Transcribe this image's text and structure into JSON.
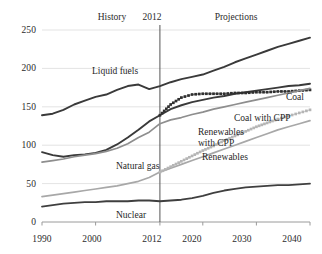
{
  "chart_data": {
    "type": "line",
    "title": "",
    "subtitle": "",
    "xlabel": "",
    "ylabel": "",
    "xlim": [
      1990,
      2040
    ],
    "ylim": [
      0,
      250
    ],
    "grid": true,
    "grid_axis": "y",
    "legend_position": "inline-annotations",
    "x_ticks": [
      "1990",
      "2000",
      "2012",
      "2020",
      "2030",
      "2040"
    ],
    "x_tick_values": [
      1990,
      2000,
      2012,
      2020,
      2030,
      2040
    ],
    "y_ticks": [
      "0",
      "50",
      "100",
      "150",
      "200",
      "250"
    ],
    "y_tick_values": [
      0,
      50,
      100,
      150,
      200,
      250
    ],
    "divider_year": 2012,
    "period_labels": [
      {
        "text": "History",
        "x": 2002
      },
      {
        "text": "2012",
        "x": 2012
      },
      {
        "text": "Projections",
        "x": 2027
      }
    ],
    "annotations": [
      {
        "text": "Liquid fuels",
        "x": 2002.5,
        "y": 196
      },
      {
        "text": "Coal",
        "x": 2038.5,
        "y": 188
      },
      {
        "text": "Coal with CPP",
        "x": 2034,
        "y": 163
      },
      {
        "text": "Renewables with CPP",
        "x": 2025.5,
        "y": 140
      },
      {
        "text": "Renewables",
        "x": 2027,
        "y": 104
      },
      {
        "text": "Natural gas",
        "x": 2006.5,
        "y": 78
      },
      {
        "text": "Nuclear",
        "x": 2012.5,
        "y": 14
      }
    ],
    "x": [
      1990,
      1992,
      1994,
      1996,
      1998,
      2000,
      2002,
      2004,
      2006,
      2008,
      2010,
      2012,
      2014,
      2016,
      2018,
      2020,
      2022,
      2024,
      2026,
      2028,
      2030,
      2032,
      2034,
      2036,
      2038,
      2040
    ],
    "series": [
      {
        "name": "Liquid fuels",
        "color": "#3a3a3a",
        "style": "solid",
        "width": 1.9,
        "values": [
          139,
          141,
          146,
          153,
          158,
          163,
          166,
          172,
          177,
          179,
          173,
          177,
          182,
          186,
          189,
          192,
          197,
          202,
          208,
          213,
          218,
          223,
          228,
          232,
          236,
          240
        ]
      },
      {
        "name": "Coal",
        "color": "#3a3a3a",
        "style": "solid",
        "width": 1.9,
        "values": [
          91,
          87,
          85,
          87,
          88,
          90,
          94,
          101,
          110,
          120,
          131,
          139,
          147,
          152,
          156,
          159,
          162,
          164,
          167,
          169,
          171,
          173,
          175,
          177,
          178,
          180
        ]
      },
      {
        "name": "Coal with CPP",
        "color": "#2f2f2f",
        "style": "dotted-square",
        "width": 1.6,
        "values": [
          null,
          null,
          null,
          null,
          null,
          null,
          null,
          null,
          null,
          null,
          null,
          139,
          153,
          162,
          166,
          167,
          167,
          167,
          168,
          168,
          169,
          169,
          170,
          170,
          171,
          172
        ]
      },
      {
        "name": "Natural gas",
        "color": "#8e8e8e",
        "style": "solid",
        "width": 1.7,
        "values": [
          78,
          80,
          82,
          85,
          87,
          89,
          92,
          96,
          102,
          110,
          117,
          128,
          133,
          136,
          140,
          143,
          147,
          150,
          153,
          156,
          159,
          162,
          165,
          168,
          171,
          174
        ]
      },
      {
        "name": "Renewables",
        "color": "#a8a8a8",
        "style": "solid",
        "width": 1.7,
        "values": [
          33,
          35,
          37,
          39,
          41,
          43,
          45,
          47,
          50,
          53,
          58,
          65,
          70,
          75,
          80,
          85,
          90,
          95,
          100,
          105,
          110,
          115,
          120,
          124,
          128,
          132
        ]
      },
      {
        "name": "Renewables with CPP",
        "color": "#b5b5b5",
        "style": "dotted-square",
        "width": 1.6,
        "values": [
          null,
          null,
          null,
          null,
          null,
          null,
          null,
          null,
          null,
          null,
          null,
          65,
          72,
          79,
          86,
          93,
          99,
          106,
          112,
          118,
          124,
          129,
          134,
          138,
          142,
          146
        ]
      },
      {
        "name": "Nuclear",
        "color": "#3f3f3f",
        "style": "solid",
        "width": 1.8,
        "values": [
          20,
          22,
          24,
          25,
          26,
          26,
          27,
          27,
          27,
          28,
          28,
          27,
          28,
          29,
          31,
          34,
          38,
          41,
          43,
          45,
          46,
          47,
          48,
          48,
          49,
          50
        ]
      }
    ]
  },
  "axes": {
    "y_label_color": "#2b2b2b",
    "x_label_color": "#2b2b2b",
    "gridline_color": "#dcdcdc",
    "axis_color": "#9a9a9a",
    "divider_color": "#555555"
  }
}
